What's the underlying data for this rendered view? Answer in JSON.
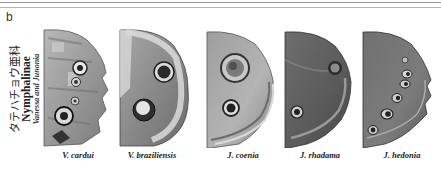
{
  "figure": {
    "panel_letter": "b",
    "caption": {
      "japanese": "タテハチョウ亜科",
      "subfamily": "Nymphalinae",
      "genera": "Vanessa and Junonia"
    },
    "specimens": [
      {
        "label": "V. cardui",
        "tone": "#8a8a8a"
      },
      {
        "label": "V. braziliensis",
        "tone": "#7a7a7a"
      },
      {
        "label": "J. coenia",
        "tone": "#8c8c8c"
      },
      {
        "label": "J. rhadama",
        "tone": "#5e5e5e"
      },
      {
        "label": "J. hedonia",
        "tone": "#6a6a6a"
      }
    ]
  }
}
